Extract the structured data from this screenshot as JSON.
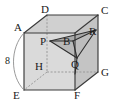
{
  "figure": {
    "width": 117,
    "height": 109,
    "background_color": "#ffffff"
  },
  "colors": {
    "edge_visible": "#3a3a3a",
    "edge_hidden": "#8a8a8a",
    "face_front": "#d8d8d8",
    "face_top": "#cfcfcf",
    "face_right": "#c2c2c2",
    "shade_dark": "#9a9a9a",
    "shade_mid": "#b4b4b4",
    "label": "#1a1a1a",
    "arc": "#8f8f8f"
  },
  "vertex_labels": [
    {
      "id": "A",
      "text": "A",
      "x": 14,
      "y": 31
    },
    {
      "id": "D",
      "text": "D",
      "x": 41,
      "y": 13
    },
    {
      "id": "C",
      "text": "C",
      "x": 101,
      "y": 14
    },
    {
      "id": "P",
      "text": "P",
      "x": 40,
      "y": 45
    },
    {
      "id": "B",
      "text": "B",
      "x": 63,
      "y": 45
    },
    {
      "id": "R",
      "text": "R",
      "x": 89,
      "y": 35
    },
    {
      "id": "H",
      "text": "H",
      "x": 35,
      "y": 70
    },
    {
      "id": "Q",
      "text": "Q",
      "x": 71,
      "y": 68
    },
    {
      "id": "G",
      "text": "G",
      "x": 101,
      "y": 76
    },
    {
      "id": "E",
      "text": "E",
      "x": 13,
      "y": 99
    },
    {
      "id": "F",
      "text": "F",
      "x": 74,
      "y": 99
    }
  ],
  "measurement_labels": [
    {
      "id": "edge-length",
      "text": "8",
      "x": 7,
      "y": 64
    }
  ],
  "geometry": {
    "cube_vertices": {
      "A": [
        24,
        33
      ],
      "D": [
        47,
        15
      ],
      "C": [
        98,
        15
      ],
      "B_corner": [
        75,
        33
      ],
      "E": [
        24,
        90
      ],
      "H": [
        47,
        72
      ],
      "G": [
        98,
        72
      ],
      "F": [
        75,
        90
      ]
    },
    "inner_points": {
      "P": [
        50,
        41
      ],
      "B": [
        73,
        41
      ],
      "Q": [
        77,
        58
      ],
      "R": [
        96,
        30
      ]
    }
  }
}
